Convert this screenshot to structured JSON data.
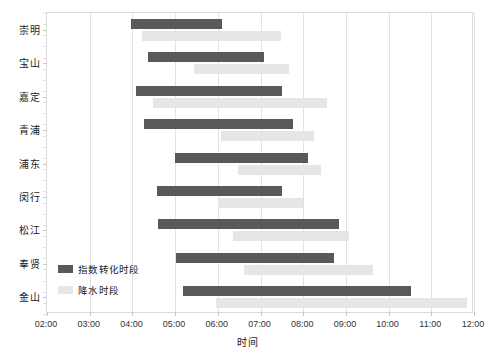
{
  "chart_data": {
    "type": "bar",
    "subtype": "horizontal-gantt-range",
    "title": "",
    "xlabel": "时间",
    "ylabel": "",
    "categories": [
      "崇明",
      "宝山",
      "嘉定",
      "青浦",
      "浦东",
      "闵行",
      "松江",
      "奉贤",
      "金山"
    ],
    "x_tick_labels": [
      "02:00",
      "03:00",
      "04:00",
      "05:00",
      "06:00",
      "07:00",
      "08:00",
      "09:00",
      "10:00",
      "11:00",
      "12:00"
    ],
    "xlim": [
      "02:00",
      "12:00"
    ],
    "grid": "vertical",
    "legend_position": "inside-bottom-left",
    "series": [
      {
        "name": "指数转化时段",
        "color": "#595959",
        "ranges": [
          {
            "category": "崇明",
            "start": "03:58",
            "end": "06:06"
          },
          {
            "category": "宝山",
            "start": "04:22",
            "end": "07:05"
          },
          {
            "category": "嘉定",
            "start": "04:05",
            "end": "07:30"
          },
          {
            "category": "青浦",
            "start": "04:17",
            "end": "07:45"
          },
          {
            "category": "浦东",
            "start": "05:00",
            "end": "08:07"
          },
          {
            "category": "闵行",
            "start": "04:35",
            "end": "07:30"
          },
          {
            "category": "松江",
            "start": "04:36",
            "end": "08:50"
          },
          {
            "category": "奉贤",
            "start": "05:01",
            "end": "08:43"
          },
          {
            "category": "金山",
            "start": "05:11",
            "end": "10:32"
          }
        ]
      },
      {
        "name": "降水时段",
        "color": "#e6e6e6",
        "ranges": [
          {
            "category": "崇明",
            "start": "04:14",
            "end": "07:29"
          },
          {
            "category": "宝山",
            "start": "05:27",
            "end": "07:40"
          },
          {
            "category": "嘉定",
            "start": "04:29",
            "end": "08:33"
          },
          {
            "category": "青浦",
            "start": "06:05",
            "end": "08:15"
          },
          {
            "category": "浦东",
            "start": "06:29",
            "end": "08:25"
          },
          {
            "category": "闵行",
            "start": "06:00",
            "end": "08:00"
          },
          {
            "category": "松江",
            "start": "06:21",
            "end": "09:05"
          },
          {
            "category": "奉贤",
            "start": "06:37",
            "end": "09:38"
          },
          {
            "category": "金山",
            "start": "05:58",
            "end": "11:50"
          }
        ]
      }
    ]
  },
  "axis": {
    "x_title": "时间"
  },
  "legend": {
    "items": [
      {
        "label": "指数转化时段",
        "color": "#595959"
      },
      {
        "label": "降水时段",
        "color": "#e6e6e6"
      }
    ]
  }
}
